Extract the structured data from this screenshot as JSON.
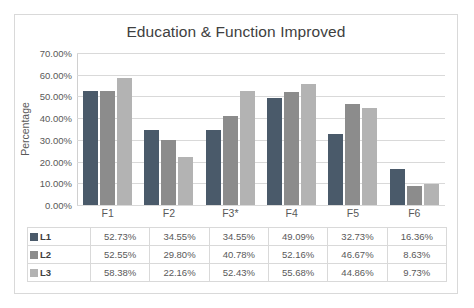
{
  "chart_data": {
    "type": "bar",
    "title": "Education & Function Improved",
    "xlabel": "",
    "ylabel": "Percentage",
    "categories": [
      "F1",
      "F2",
      "F3*",
      "F4",
      "F5",
      "F6"
    ],
    "series": [
      {
        "name": "L1",
        "color": "#4a5a6a",
        "values": [
          52.73,
          34.55,
          34.55,
          49.09,
          32.73,
          16.36
        ],
        "labels": [
          "52.73%",
          "34.55%",
          "34.55%",
          "49.09%",
          "32.73%",
          "16.36%"
        ]
      },
      {
        "name": "L2",
        "color": "#8c8c8c",
        "values": [
          52.55,
          29.8,
          40.78,
          52.16,
          46.67,
          8.63
        ],
        "labels": [
          "52.55%",
          "29.80%",
          "40.78%",
          "52.16%",
          "46.67%",
          "8.63%"
        ]
      },
      {
        "name": "L3",
        "color": "#b3b3b3",
        "values": [
          58.38,
          22.16,
          52.43,
          55.68,
          44.86,
          9.73
        ],
        "labels": [
          "58.38%",
          "22.16%",
          "52.43%",
          "55.68%",
          "44.86%",
          "9.73%"
        ]
      }
    ],
    "ylim": [
      0,
      70
    ],
    "yticks": [
      "0.00%",
      "10.00%",
      "20.00%",
      "30.00%",
      "40.00%",
      "50.00%",
      "60.00%",
      "70.00%"
    ],
    "ytick_values": [
      0,
      10,
      20,
      30,
      40,
      50,
      60,
      70
    ],
    "grid": true,
    "legend_position": "data-table-left"
  }
}
